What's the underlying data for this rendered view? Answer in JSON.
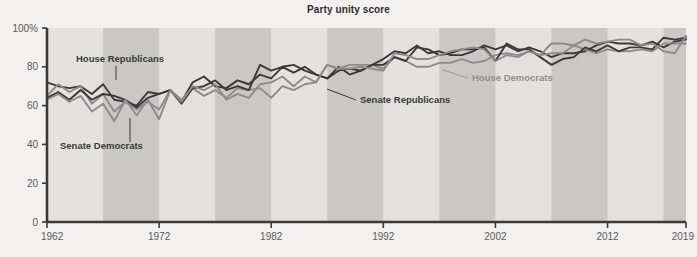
{
  "chart_data": {
    "type": "line",
    "title": "Party unity score",
    "xlabel": "",
    "ylabel": "",
    "xlim": [
      1962,
      2019
    ],
    "ylim": [
      0,
      100
    ],
    "grid": false,
    "legend_position": "inline-annotations",
    "y_ticks": [
      "0",
      "20",
      "40",
      "60",
      "80",
      "100%"
    ],
    "y_tick_values": [
      0,
      20,
      40,
      60,
      80,
      100
    ],
    "x_ticks": [
      "1962",
      "1972",
      "1982",
      "1992",
      "2002",
      "2012",
      "2019"
    ],
    "x_tick_values": [
      1962,
      1972,
      1982,
      1992,
      2002,
      2012,
      2019
    ],
    "x": [
      1962,
      1963,
      1964,
      1965,
      1966,
      1967,
      1968,
      1969,
      1970,
      1971,
      1972,
      1973,
      1974,
      1975,
      1976,
      1977,
      1978,
      1979,
      1980,
      1981,
      1982,
      1983,
      1984,
      1985,
      1986,
      1987,
      1988,
      1989,
      1990,
      1991,
      1992,
      1993,
      1994,
      1995,
      1996,
      1997,
      1998,
      1999,
      2000,
      2001,
      2002,
      2003,
      2004,
      2005,
      2006,
      2007,
      2008,
      2009,
      2010,
      2011,
      2012,
      2013,
      2014,
      2015,
      2016,
      2017,
      2018,
      2019
    ],
    "series": [
      {
        "name": "House Republicans",
        "color": "#3a3a3c",
        "values": [
          72,
          70,
          69,
          70,
          66,
          71,
          63,
          62,
          60,
          67,
          66,
          68,
          62,
          72,
          75,
          70,
          69,
          73,
          71,
          76,
          74,
          80,
          77,
          80,
          76,
          74,
          80,
          76,
          78,
          81,
          84,
          88,
          87,
          91,
          87,
          88,
          86,
          86,
          88,
          91,
          89,
          91,
          88,
          90,
          88,
          85,
          87,
          87,
          88,
          91,
          93,
          92,
          92,
          91,
          93,
          90,
          93,
          94
        ]
      },
      {
        "name": "House Democrats",
        "color": "#8c8c8e",
        "values": [
          65,
          71,
          67,
          70,
          61,
          66,
          57,
          62,
          58,
          62,
          58,
          68,
          63,
          69,
          65,
          68,
          64,
          69,
          68,
          69,
          64,
          70,
          68,
          71,
          72,
          81,
          79,
          81,
          81,
          81,
          79,
          85,
          83,
          80,
          80,
          82,
          82,
          84,
          82,
          83,
          86,
          87,
          86,
          88,
          86,
          92,
          92,
          91,
          89,
          87,
          89,
          88,
          88,
          89,
          88,
          92,
          92,
          92
        ]
      },
      {
        "name": "Senate Republicans",
        "color": "#3a3a3c",
        "values": [
          64,
          67,
          63,
          68,
          63,
          66,
          65,
          63,
          59,
          64,
          66,
          68,
          61,
          69,
          70,
          73,
          68,
          70,
          68,
          81,
          78,
          80,
          81,
          78,
          76,
          74,
          78,
          79,
          78,
          81,
          81,
          85,
          83,
          90,
          89,
          86,
          87,
          89,
          89,
          90,
          83,
          92,
          89,
          89,
          85,
          81,
          84,
          85,
          90,
          88,
          91,
          88,
          90,
          90,
          89,
          95,
          94,
          95
        ]
      },
      {
        "name": "Senate Democrats",
        "color": "#8c8c8e",
        "values": [
          63,
          66,
          62,
          65,
          57,
          61,
          52,
          63,
          55,
          63,
          53,
          68,
          62,
          70,
          68,
          71,
          63,
          66,
          64,
          71,
          72,
          75,
          70,
          75,
          72,
          81,
          79,
          79,
          80,
          79,
          78,
          87,
          86,
          84,
          84,
          86,
          88,
          89,
          90,
          89,
          83,
          86,
          85,
          88,
          86,
          87,
          87,
          91,
          94,
          92,
          93,
          94,
          94,
          91,
          92,
          88,
          87,
          96
        ]
      }
    ],
    "annotations": [
      {
        "name": "House Republicans",
        "text": "House Republicans",
        "style": "dark"
      },
      {
        "name": "Senate Democrats",
        "text": "Senate Democrats",
        "style": "dark"
      },
      {
        "name": "Senate Republicans",
        "text": "Senate Republicans",
        "style": "dark"
      },
      {
        "name": "House Democrats",
        "text": "House Democrats",
        "style": "light"
      }
    ],
    "band_color_light": "#e3e2df",
    "band_color_dark": "#c9c8c5",
    "axis_color": "#3a3a3c",
    "background": "#f2f1ef"
  },
  "annotation_labels": {
    "house_republicans": "House Republicans",
    "senate_democrats": "Senate Democrats",
    "senate_republicans": "Senate Republicans",
    "house_democrats": "House Democrats"
  },
  "axis": {
    "y0": "0",
    "y20": "20",
    "y40": "40",
    "y60": "60",
    "y80": "80",
    "y100": "100%",
    "x1962": "1962",
    "x1972": "1972",
    "x1982": "1982",
    "x1992": "1992",
    "x2002": "2002",
    "x2012": "2012",
    "x2019": "2019"
  }
}
